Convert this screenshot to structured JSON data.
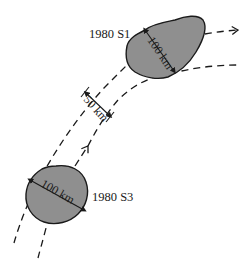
{
  "figure": {
    "type": "diagram",
    "colors": {
      "moon_fill": "#8f8f8f",
      "stroke": "#1a1a1a",
      "background": "#ffffff"
    },
    "moons": [
      {
        "name": "1980 S1",
        "diameter_label": "100 km",
        "shape": "irregular"
      },
      {
        "name": "1980 S3",
        "diameter_label": "100 km",
        "shape": "round"
      }
    ],
    "orbits": [
      {
        "name": "outer-orbit",
        "style": "dashed",
        "direction_arrow": "right"
      },
      {
        "name": "inner-orbit",
        "style": "dashed",
        "direction_arrow": "up"
      }
    ],
    "separation_label": "50 km"
  }
}
